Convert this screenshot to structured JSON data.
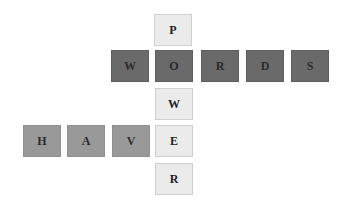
{
  "puzzle": {
    "vertical_word": "POWER",
    "horizontal_words": [
      "WORDS",
      "HAVE"
    ],
    "tiles": [
      {
        "letter": "P",
        "x": 154,
        "y": 14,
        "style": "light"
      },
      {
        "letter": "W",
        "x": 111,
        "y": 50,
        "style": "dark"
      },
      {
        "letter": "O",
        "x": 155,
        "y": 50,
        "style": "dark"
      },
      {
        "letter": "R",
        "x": 201,
        "y": 50,
        "style": "dark"
      },
      {
        "letter": "D",
        "x": 246,
        "y": 50,
        "style": "dark"
      },
      {
        "letter": "S",
        "x": 291,
        "y": 50,
        "style": "dark"
      },
      {
        "letter": "W",
        "x": 155,
        "y": 88,
        "style": "light"
      },
      {
        "letter": "H",
        "x": 23,
        "y": 125,
        "style": "medium"
      },
      {
        "letter": "A",
        "x": 67,
        "y": 125,
        "style": "medium"
      },
      {
        "letter": "V",
        "x": 112,
        "y": 125,
        "style": "medium"
      },
      {
        "letter": "E",
        "x": 155,
        "y": 125,
        "style": "light"
      },
      {
        "letter": "R",
        "x": 155,
        "y": 163,
        "style": "light"
      }
    ]
  },
  "colors": {
    "light": "#ebebeb",
    "dark": "#6a6a6a",
    "medium": "#999999"
  }
}
